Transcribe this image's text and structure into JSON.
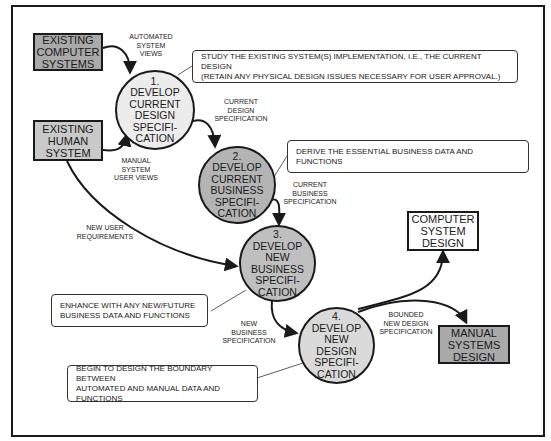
{
  "colors": {
    "line": "#1a1a1a",
    "existing_computer_fill": "#a9a9a9",
    "existing_human_fill": "#c9c9c9",
    "manual_design_fill": "#a9a9a9",
    "computer_design_fill": "#ffffff",
    "process1_fill": "#ececec",
    "process2_fill": "#b4b4b4",
    "process3_fill": "#bfbfbf",
    "process4_fill": "#dadada"
  },
  "entities": {
    "existing_computer": "EXISTING\nCOMPUTER\nSYSTEMS",
    "existing_human": "EXISTING\nHUMAN\nSYSTEM",
    "computer_design": "COMPUTER\nSYSTEM\nDESIGN",
    "manual_design": "MANUAL\nSYSTEMS\nDESIGN"
  },
  "processes": [
    {
      "number": "1.",
      "lines": [
        "DEVELOP",
        "CURRENT",
        "DESIGN",
        "SPECIFI-",
        "CATION"
      ]
    },
    {
      "number": "2.",
      "lines": [
        "DEVELOP",
        "CURRENT",
        "BUSINESS",
        "SPECIFI-",
        "CATION"
      ]
    },
    {
      "number": "3.",
      "lines": [
        "DEVELOP",
        "NEW",
        "BUSINESS",
        "SPECIFI-",
        "CATION"
      ]
    },
    {
      "number": "4.",
      "lines": [
        "DEVELOP",
        "NEW",
        "DESIGN",
        "SPECIFI-",
        "CATION"
      ]
    }
  ],
  "flow_labels": {
    "automated_views": "AUTOMATED\nSYSTEM\nVIEWS",
    "manual_views": "MANUAL\nSYSTEM\nUSER VIEWS",
    "current_design_spec": "CURRENT\nDESIGN\nSPECIFICATION",
    "current_business_spec": "CURRENT\nBUSINESS\nSPECIFICATION",
    "new_user_requirements": "NEW USER\nREQUIREMENTS",
    "new_business_spec": "NEW\nBUSINESS\nSPECIFICATION",
    "bounded_new_design_spec": "BOUNDED\nNEW DESIGN\nSPECIFICATION"
  },
  "notes": {
    "note1": [
      "STUDY THE EXISTING SYSTEM(S) IMPLEMENTATION, I.E., THE CURRENT DESIGN",
      "(RETAIN ANY PHYSICAL DESIGN ISSUES NECESSARY FOR USER APPROVAL.)"
    ],
    "note2": [
      "DERIVE THE ESSENTIAL BUSINESS DATA AND FUNCTIONS"
    ],
    "note3": [
      "ENHANCE WITH ANY NEW/FUTURE",
      "BUSINESS DATA AND FUNCTIONS"
    ],
    "note4": [
      "BEGIN TO DESIGN THE BOUNDARY BETWEEN",
      "AUTOMATED AND MANUAL DATA AND",
      "FUNCTIONS"
    ]
  }
}
